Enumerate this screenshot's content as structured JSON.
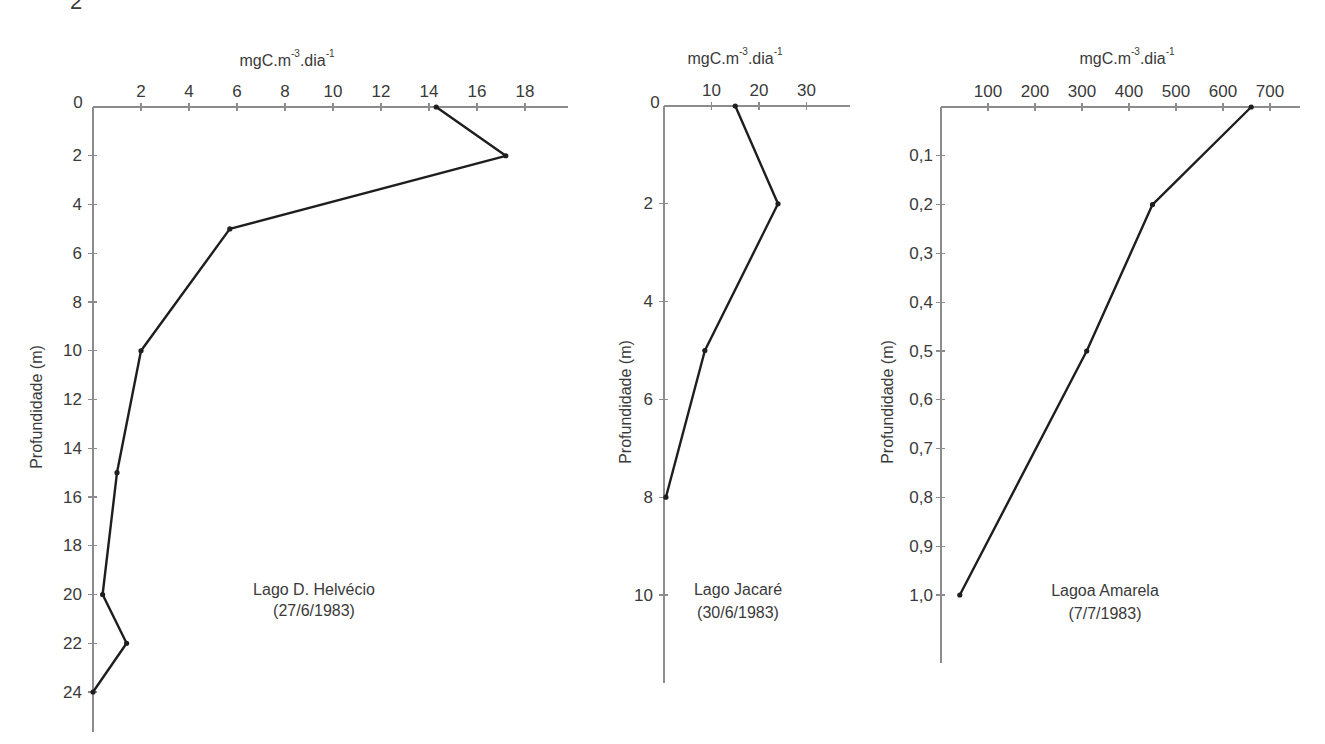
{
  "page": {
    "corner_label": "2"
  },
  "chart_data": [
    {
      "type": "line",
      "title": "Lago D. Helvécio",
      "subtitle": "(27/6/1983)",
      "xlabel": "mgC.m-3.dia-1",
      "xlabel_parts": [
        "mgC.m",
        "-3",
        ".dia",
        "-1"
      ],
      "ylabel": "Profundidade (m)",
      "origin_label": "0",
      "x_ticks": [
        2,
        4,
        6,
        8,
        10,
        12,
        14,
        16,
        18
      ],
      "x_tick_labels": [
        "2",
        "4",
        "6",
        "8",
        "10",
        "12",
        "14",
        "16",
        "18"
      ],
      "y_ticks": [
        2,
        4,
        6,
        8,
        10,
        12,
        14,
        16,
        18,
        20,
        22,
        24
      ],
      "y_tick_labels": [
        "2",
        "4",
        "6",
        "8",
        "10",
        "12",
        "14",
        "16",
        "18",
        "20",
        "22",
        "24"
      ],
      "xlim": [
        0,
        20
      ],
      "ylim": [
        0,
        25.5
      ],
      "y_inverted": true,
      "grid": false,
      "series": [
        {
          "name": "Lago D. Helvécio (27/6/1983)",
          "depth": [
            0,
            2,
            5,
            10,
            15,
            20,
            22,
            24
          ],
          "values": [
            14.3,
            17.2,
            5.7,
            2.0,
            1.0,
            0.4,
            1.4,
            0.0
          ]
        }
      ]
    },
    {
      "type": "line",
      "title": "Lago Jacaré",
      "subtitle": "(30/6/1983)",
      "xlabel": "mgC.m-3.dia-1",
      "xlabel_parts": [
        "mgC.m",
        "-3",
        ".dia",
        "-1"
      ],
      "ylabel": "Profundidade (m)",
      "origin_label": "0",
      "x_ticks": [
        10,
        20,
        30
      ],
      "x_tick_labels": [
        "10",
        "20",
        "30"
      ],
      "y_ticks": [
        2,
        4,
        6,
        8,
        10
      ],
      "y_tick_labels": [
        "2",
        "4",
        "6",
        "8",
        "10"
      ],
      "xlim": [
        0,
        39
      ],
      "ylim": [
        0,
        11.8
      ],
      "y_inverted": true,
      "grid": false,
      "series": [
        {
          "name": "Lago Jacaré (30/6/1983)",
          "depth": [
            0,
            2,
            5,
            8
          ],
          "values": [
            15,
            24,
            8.6,
            0.4
          ]
        }
      ]
    },
    {
      "type": "line",
      "title": "Lagoa Amarela",
      "subtitle": "(7/7/1983)",
      "xlabel": "mgC.m-3.dia-1",
      "xlabel_parts": [
        "mgC.m",
        "-3",
        ".dia",
        "-1"
      ],
      "ylabel": "Profundidade (m)",
      "origin_label": "",
      "x_ticks": [
        100,
        200,
        300,
        400,
        500,
        600,
        700
      ],
      "x_tick_labels": [
        "100",
        "200",
        "300",
        "400",
        "500",
        "600",
        "700"
      ],
      "y_ticks": [
        0.1,
        0.2,
        0.3,
        0.4,
        0.5,
        0.6,
        0.7,
        0.8,
        0.9,
        1.0
      ],
      "y_tick_labels": [
        "0,1",
        "0,2",
        "0,3",
        "0,4",
        "0,5",
        "0,6",
        "0,7",
        "0,8",
        "0,9",
        "1,0"
      ],
      "xlim": [
        0,
        760
      ],
      "ylim": [
        0,
        1.14
      ],
      "y_inverted": true,
      "grid": false,
      "series": [
        {
          "name": "Lagoa Amarela (7/7/1983)",
          "depth": [
            0,
            0.2,
            0.5,
            1.0
          ],
          "values": [
            660,
            450,
            310,
            40
          ]
        }
      ]
    }
  ]
}
